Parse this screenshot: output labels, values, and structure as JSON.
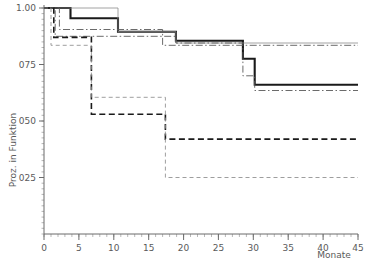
{
  "chart_data": {
    "type": "line",
    "title": "",
    "subtitle": "",
    "xlabel": "Monate",
    "ylabel": "Proz. in Funktion",
    "xlim": [
      0,
      45
    ],
    "ylim": [
      0.13,
      1.02
    ],
    "grid": false,
    "legend_position": "none",
    "x_ticks": [
      0,
      5,
      10,
      15,
      20,
      25,
      30,
      35,
      40,
      45
    ],
    "x_tick_labels": [
      "0",
      "5",
      "10",
      "15",
      "20",
      "25",
      "30",
      "35",
      "40",
      "45"
    ],
    "x_minor_tick_step": 1,
    "y_ticks": [
      0.25,
      0.5,
      0.75,
      1.0
    ],
    "y_tick_labels": [
      "025",
      "050",
      "075",
      "1.00"
    ],
    "y_minor_tick_step": 0.025,
    "step_type": "post",
    "series": [
      {
        "name": "curve-thick-solid",
        "style": "solid",
        "width": 2.1,
        "color": "#1a1a1a",
        "x": [
          0,
          3.8,
          7.0,
          10.6,
          13.0,
          17.0,
          18.9,
          28.5,
          30.2,
          45
        ],
        "y": [
          1.0,
          1.0,
          0.955,
          0.955,
          0.895,
          0.895,
          0.855,
          0.855,
          0.735,
          0.66
        ],
        "points": [
          {
            "x": 0,
            "y": 1.0
          },
          {
            "x": 3.8,
            "y": 1.0
          },
          {
            "x": 3.8,
            "y": 0.955
          },
          {
            "x": 10.6,
            "y": 0.955
          },
          {
            "x": 10.6,
            "y": 0.895
          },
          {
            "x": 18.9,
            "y": 0.895
          },
          {
            "x": 18.9,
            "y": 0.855
          },
          {
            "x": 28.5,
            "y": 0.855
          },
          {
            "x": 28.5,
            "y": 0.775
          },
          {
            "x": 30.2,
            "y": 0.775
          },
          {
            "x": 30.2,
            "y": 0.66
          },
          {
            "x": 45,
            "y": 0.66
          }
        ]
      },
      {
        "name": "curve-thin-solid",
        "style": "solid",
        "width": 0.8,
        "color": "#8c8c8c",
        "points": [
          {
            "x": 0,
            "y": 1.0
          },
          {
            "x": 10.6,
            "y": 1.0
          },
          {
            "x": 10.6,
            "y": 0.895
          },
          {
            "x": 18.9,
            "y": 0.895
          },
          {
            "x": 18.9,
            "y": 0.845
          },
          {
            "x": 45,
            "y": 0.845
          }
        ]
      },
      {
        "name": "curve-thin-dashdot-upper",
        "style": "dash-dot",
        "width": 0.9,
        "color": "#5a5a5a",
        "points": [
          {
            "x": 0,
            "y": 1.0
          },
          {
            "x": 2.2,
            "y": 1.0
          },
          {
            "x": 2.2,
            "y": 0.905
          },
          {
            "x": 17.0,
            "y": 0.905
          },
          {
            "x": 17.0,
            "y": 0.835
          },
          {
            "x": 45,
            "y": 0.835
          }
        ]
      },
      {
        "name": "curve-thin-dashdot-lower",
        "style": "dash-dot",
        "width": 0.9,
        "color": "#5a5a5a",
        "points": [
          {
            "x": 0,
            "y": 1.0
          },
          {
            "x": 1.6,
            "y": 1.0
          },
          {
            "x": 1.6,
            "y": 0.875
          },
          {
            "x": 18.9,
            "y": 0.875
          },
          {
            "x": 18.9,
            "y": 0.845
          },
          {
            "x": 28.5,
            "y": 0.845
          },
          {
            "x": 28.5,
            "y": 0.7
          },
          {
            "x": 30.2,
            "y": 0.7
          },
          {
            "x": 30.2,
            "y": 0.635
          },
          {
            "x": 45,
            "y": 0.635
          }
        ]
      },
      {
        "name": "curve-bold-dashed",
        "style": "dashed",
        "width": 1.6,
        "color": "#1a1a1a",
        "points": [
          {
            "x": 0,
            "y": 1.0
          },
          {
            "x": 1.4,
            "y": 1.0
          },
          {
            "x": 1.4,
            "y": 0.87
          },
          {
            "x": 6.8,
            "y": 0.87
          },
          {
            "x": 6.8,
            "y": 0.53
          },
          {
            "x": 17.4,
            "y": 0.53
          },
          {
            "x": 17.4,
            "y": 0.42
          },
          {
            "x": 45,
            "y": 0.42
          }
        ]
      },
      {
        "name": "curve-thin-dashed",
        "style": "dashed",
        "width": 0.85,
        "color": "#8c8c8c",
        "points": [
          {
            "x": 0,
            "y": 1.0
          },
          {
            "x": 1.0,
            "y": 1.0
          },
          {
            "x": 1.0,
            "y": 0.835
          },
          {
            "x": 6.8,
            "y": 0.835
          },
          {
            "x": 6.8,
            "y": 0.605
          },
          {
            "x": 17.4,
            "y": 0.605
          },
          {
            "x": 17.4,
            "y": 0.25
          },
          {
            "x": 45,
            "y": 0.25
          }
        ]
      }
    ],
    "colors": {
      "axis": "#6b6b6b",
      "text": "#5a5a5a",
      "thick_line": "#1a1a1a",
      "thin_line": "#8c8c8c",
      "background": "#ffffff"
    }
  }
}
